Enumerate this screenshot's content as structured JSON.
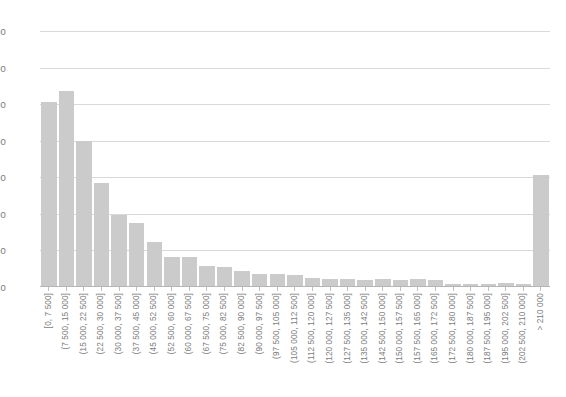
{
  "chart_data": {
    "type": "bar",
    "title": "",
    "subtitle": "",
    "xlabel": "",
    "ylabel": "",
    "grid": true,
    "legend": false,
    "ylim": [
      0,
      700
    ],
    "yticks": [
      0,
      100,
      200,
      300,
      400,
      500,
      600,
      700
    ],
    "ytick_labels": [
      "0",
      "100",
      "200",
      "300",
      "400",
      "500",
      "600",
      "700"
    ],
    "bar_color": "#cbcbcb",
    "gridline_color": "#d9d9d9",
    "axis_color": "#b5b5b5",
    "text_color": "#7a7a7a",
    "categories": [
      "[0, 7 500]",
      "(7 500, 15 000]",
      "(15 000, 22 500]",
      "(22 500, 30 000]",
      "(30 000, 37 500]",
      "(37 500, 45 000]",
      "(45 000, 52 500]",
      "(52 500, 60 000]",
      "(60 000, 67 500]",
      "(67 500, 75 000]",
      "(75 000, 82 500]",
      "(82 500, 90 000]",
      "(90 000, 97 500]",
      "(97 500, 105 000]",
      "(105 000, 112 500]",
      "(112 500, 120 000]",
      "(120 000, 127 500]",
      "(127 500, 135 000]",
      "(135 000, 142 500]",
      "(142 500, 150 000]",
      "(150 000, 157 500]",
      "(157 500, 165 000]",
      "(165 000, 172 500]",
      "(172 500, 180 000]",
      "(180 000, 187 500]",
      "(187 500, 195 000]",
      "(195 000, 202 500]",
      "(202 500, 210 000]",
      "> 210 000"
    ],
    "values": [
      505,
      537,
      398,
      285,
      197,
      175,
      124,
      83,
      81,
      57,
      56,
      43,
      35,
      35,
      33,
      25,
      23,
      21,
      20,
      21,
      20,
      21,
      18,
      9,
      9,
      9,
      10,
      9,
      305
    ]
  }
}
